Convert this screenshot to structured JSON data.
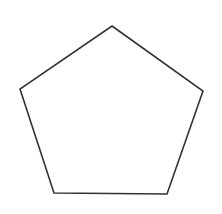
{
  "diagram": {
    "shape": "pentagon",
    "stroke_color": "#333333",
    "fill_color": "#ffffff",
    "stroke_width": 1.6,
    "vertices": [
      [
        112,
        26
      ],
      [
        203,
        91
      ],
      [
        167,
        194
      ],
      [
        54,
        193
      ],
      [
        20,
        89
      ]
    ]
  }
}
